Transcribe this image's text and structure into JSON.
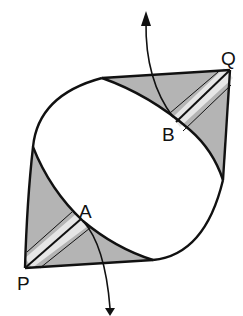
{
  "diagram": {
    "labels": {
      "P": "P",
      "Q": "Q",
      "A": "A",
      "B": "B"
    },
    "colors": {
      "line": "#111111",
      "shade": "#b4b4b4",
      "band": "#e6e6e6",
      "background": "#ffffff"
    },
    "elements": {
      "shaded_regions": [
        "top-right region Q-B",
        "bottom-left region P-A"
      ],
      "hatched_bands": [
        "band through B toward Q",
        "band through A toward P"
      ],
      "arrow": "curve entering from bottom through A and exiting at top through B"
    }
  }
}
